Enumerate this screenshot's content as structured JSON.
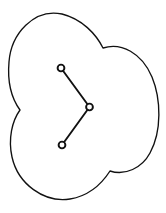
{
  "figure": {
    "canvas": {
      "width": 166,
      "height": 213,
      "background": "#ffffff"
    },
    "stroke_color": "#111111",
    "fill_color": "#ffffff",
    "outline": {
      "name": "clover-outline",
      "description": "Smooth closed curve formed by three overlapping circular lobes with three concave cusps",
      "lobe_count": 3,
      "bounds": {
        "x_min": 8,
        "y_min": 12,
        "x_max": 158,
        "y_max": 200
      },
      "cusps": [
        {
          "x": 103,
          "y": 48
        },
        {
          "x": 20,
          "y": 110
        },
        {
          "x": 110,
          "y": 171
        }
      ],
      "path": "M 103 48 C 96 34 82 19 62 14 C 34 8 11 34 9 62 C 7 85 12 99 20 110 C 12 121 8 139 12 157 C 18 184 44 203 70 199 C 88 196 101 185 110 171 C 125 176 142 168 150 153 C 162 131 161 99 152 77 C 142 53 121 42 103 48 Z"
    },
    "polyline": {
      "name": "three-node-polyline",
      "node_count": 3,
      "edge_count": 2,
      "node_radius": 3.4,
      "nodes": [
        {
          "id": "node-1",
          "x": 61,
          "y": 68
        },
        {
          "id": "node-2",
          "x": 89.5,
          "y": 107
        },
        {
          "id": "node-3",
          "x": 62,
          "y": 145
        }
      ],
      "edges": [
        {
          "id": "edge-1",
          "from": "node-1",
          "to": "node-2",
          "x1": 61,
          "y1": 68,
          "x2": 89.5,
          "y2": 107
        },
        {
          "id": "edge-2",
          "from": "node-2",
          "to": "node-3",
          "x1": 89.5,
          "y1": 107,
          "x2": 62,
          "y2": 145
        }
      ]
    }
  }
}
